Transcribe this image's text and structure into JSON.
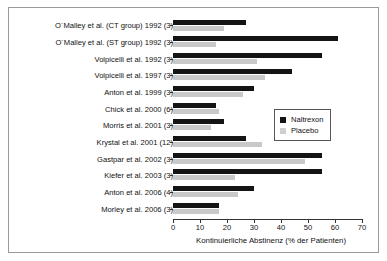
{
  "chart_data": {
    "type": "bar",
    "orientation": "horizontal",
    "title": "",
    "xlabel": "Kontinuierliche Abstinenz (% der Patienten)",
    "ylabel": "",
    "xlim": [
      0,
      70
    ],
    "xticks": [
      0,
      10,
      20,
      30,
      40,
      50,
      60,
      70
    ],
    "grid": false,
    "legend_position": "right-middle",
    "categories": [
      "O´Malley et al. (CT group) 1992 (3)",
      "O´Malley et al. (ST group) 1992 (3)",
      "Volpicelli et al. 1992 (3)",
      "Volpicelli et al. 1997 (3)",
      "Anton et al. 1999 (3)",
      "Chick et al. 2000 (6)",
      "Morris et al. 2001 (3)",
      "Krystal et al. 2001 (12)",
      "Gastpar et al. 2002 (3)",
      "Kiefer et al. 2003 (3)",
      "Anton et al. 2006 (4)",
      "Morley et al. 2006 (3)"
    ],
    "series": [
      {
        "name": "Naltrexon",
        "color": "#141414",
        "values": [
          27,
          61,
          55,
          44,
          30,
          16,
          19,
          27,
          55,
          55,
          30,
          17
        ]
      },
      {
        "name": "Placebo",
        "color": "#c9c9c9",
        "values": [
          19,
          16,
          31,
          34,
          26,
          17,
          14,
          33,
          49,
          23,
          24,
          17
        ]
      }
    ]
  },
  "legend": {
    "items": [
      {
        "label": "Naltrexon"
      },
      {
        "label": "Placebo"
      }
    ]
  }
}
